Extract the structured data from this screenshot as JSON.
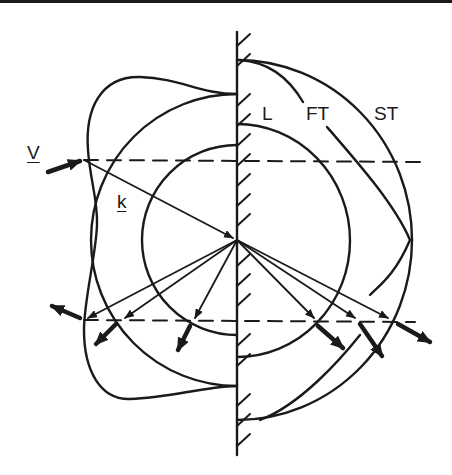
{
  "figure": {
    "type": "slowness-surface reflection diagram",
    "labels": {
      "longitudinal": "L",
      "fast_transverse": "FT",
      "slow_transverse": "ST",
      "group_velocity": "V",
      "wave_vector": "k"
    },
    "elements": [
      "rigid boundary wall with hatching",
      "incident wave vector k",
      "incident group velocity V",
      "dashed conservation lines",
      "reflected wave vectors",
      "reflected group velocity arrows"
    ],
    "colors": {
      "ink": "#1a1a1a",
      "background": "#ffffff"
    }
  }
}
